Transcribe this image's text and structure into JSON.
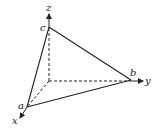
{
  "diagram": {
    "type": "3d-coordinate-tetrahedron",
    "axes": {
      "x": "x",
      "y": "y",
      "z": "z"
    },
    "points": {
      "a": "a",
      "b": "b",
      "c": "c"
    },
    "stroke_color": "#222222"
  }
}
